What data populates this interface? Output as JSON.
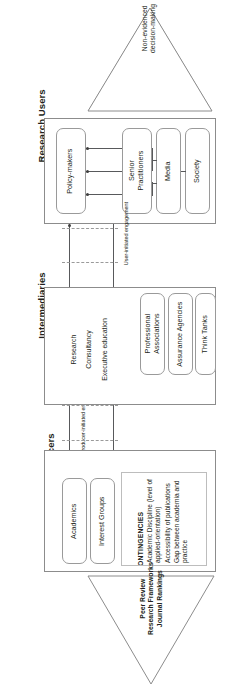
{
  "diagram": {
    "orientation": "rotated-90",
    "accent_color": "#58595b",
    "box_border_color": "#9a9a9a"
  },
  "bands": [
    {
      "id": "research-users",
      "title": "Research Users",
      "entities": [
        {
          "label": "Policy-makers"
        },
        {
          "label": "Senior\nPractitioners"
        },
        {
          "label": "Media"
        },
        {
          "label": "Society"
        }
      ]
    },
    {
      "id": "intermediaries",
      "title": "Intermediaries",
      "entities": [
        {
          "label": "Professional\nAssociations"
        },
        {
          "label": "Assurance Agencies"
        },
        {
          "label": "Think Tanks"
        }
      ]
    },
    {
      "id": "research-producers",
      "title": "Research Producers",
      "entities": [
        {
          "label": "Academics"
        },
        {
          "label": "Interest Groups"
        }
      ]
    }
  ],
  "band_titles": {
    "users": "Research Users",
    "intermediaries": "Intermediaries",
    "producers": "Research Producers"
  },
  "entities": {
    "policy_makers": "Policy-makers",
    "senior_practitioners_line1": "Senior",
    "senior_practitioners_line2": "Practitioners",
    "media": "Media",
    "society": "Society",
    "professional_associations_line1": "Professional",
    "professional_associations_line2": "Associations",
    "assurance_agencies": "Assurance Agencies",
    "think_tanks": "Think Tanks",
    "academics": "Academics",
    "interest_groups": "Interest Groups"
  },
  "channels": {
    "research": "Research",
    "consultancy": "Consultancy",
    "executive_education": "Executive education"
  },
  "flows": {
    "user_initiated": "User-initiated engagement",
    "producer_initiated": "Producer-initiated engagement"
  },
  "top_triangle": {
    "label_line1": "Non-evidenced",
    "label_line2": "decision-making"
  },
  "bottom_triangle": {
    "label_line1": "Peer Review",
    "label_line2": "Research Frameworks",
    "label_line3": "Journal Rankings"
  },
  "contingencies": {
    "title": "CONTINGENCIES",
    "items": [
      "Academic Discipline (level of applied-orientation)",
      "Accessibility of publications",
      "Gap between academia and practice"
    ]
  }
}
